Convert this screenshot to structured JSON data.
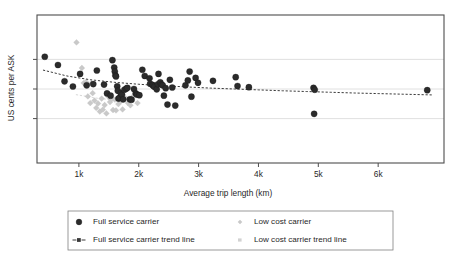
{
  "chart_data": {
    "type": "scatter",
    "title": "",
    "xlabel": "Average trip length (km)",
    "ylabel": "US cents per ASK",
    "xlim": [
      300,
      7100
    ],
    "ylim": [
      0,
      10
    ],
    "xticks": [
      1000,
      2000,
      3000,
      4000,
      5000,
      6000
    ],
    "xticklabels": [
      "1k",
      "2k",
      "3k",
      "4k",
      "5k",
      "6k"
    ],
    "yticks": [
      3.0,
      5.0,
      7.0
    ],
    "yticklabels": [
      "",
      "",
      ""
    ],
    "grid": "horizontal",
    "legend_position": "below-outside",
    "colors": {
      "full_service": "#2b2b2b",
      "low_cost": "#c9c9c9",
      "trend_full_service": "#3a3a3a",
      "trend_low_cost": "#d2d2d2",
      "frame": "#4d4d4d",
      "gridline": "#d8d8d8",
      "background": "#ffffff"
    },
    "series": [
      {
        "name": "Full service carrier",
        "marker": "circle",
        "color": "#2b2b2b",
        "points": [
          [
            430,
            7.18
          ],
          [
            650,
            6.62
          ],
          [
            760,
            5.52
          ],
          [
            900,
            5.17
          ],
          [
            1020,
            6.02
          ],
          [
            1130,
            5.25
          ],
          [
            1240,
            5.33
          ],
          [
            1300,
            6.25
          ],
          [
            1420,
            5.3
          ],
          [
            1470,
            4.7
          ],
          [
            1530,
            4.55
          ],
          [
            1560,
            6.95
          ],
          [
            1590,
            6.45
          ],
          [
            1600,
            6.18
          ],
          [
            1610,
            5.92
          ],
          [
            1620,
            5.85
          ],
          [
            1640,
            5.18
          ],
          [
            1650,
            4.88
          ],
          [
            1660,
            4.35
          ],
          [
            1680,
            4.4
          ],
          [
            1700,
            4.72
          ],
          [
            1720,
            4.62
          ],
          [
            1740,
            4.3
          ],
          [
            1760,
            4.95
          ],
          [
            1790,
            5.02
          ],
          [
            1810,
            5.08
          ],
          [
            1850,
            4.3
          ],
          [
            1880,
            4.28
          ],
          [
            1920,
            5.0
          ],
          [
            1950,
            4.7
          ],
          [
            1970,
            4.62
          ],
          [
            2010,
            4.58
          ],
          [
            2060,
            6.3
          ],
          [
            2100,
            5.88
          ],
          [
            2180,
            5.72
          ],
          [
            2190,
            5.35
          ],
          [
            2230,
            5.28
          ],
          [
            2240,
            5.22
          ],
          [
            2260,
            5.15
          ],
          [
            2300,
            4.98
          ],
          [
            2320,
            5.32
          ],
          [
            2330,
            6.02
          ],
          [
            2360,
            5.45
          ],
          [
            2380,
            5.3
          ],
          [
            2400,
            5.25
          ],
          [
            2420,
            4.55
          ],
          [
            2450,
            5.05
          ],
          [
            2480,
            3.95
          ],
          [
            2520,
            5.62
          ],
          [
            2560,
            5.1
          ],
          [
            2610,
            3.88
          ],
          [
            2780,
            5.25
          ],
          [
            2820,
            5.58
          ],
          [
            2850,
            6.18
          ],
          [
            2880,
            4.48
          ],
          [
            2950,
            5.75
          ],
          [
            2990,
            5.42
          ],
          [
            3240,
            5.55
          ],
          [
            3620,
            5.8
          ],
          [
            3650,
            5.2
          ],
          [
            3840,
            5.12
          ],
          [
            4920,
            5.08
          ],
          [
            4940,
            4.95
          ],
          [
            4930,
            3.32
          ],
          [
            6820,
            4.92
          ]
        ]
      },
      {
        "name": "Low cost carrier",
        "marker": "diamond",
        "color": "#c9c9c9",
        "points": [
          [
            960,
            8.15
          ],
          [
            1050,
            6.42
          ],
          [
            1080,
            5.4
          ],
          [
            1120,
            5.48
          ],
          [
            1150,
            4.5
          ],
          [
            1190,
            4.05
          ],
          [
            1210,
            5.38
          ],
          [
            1230,
            4.72
          ],
          [
            1260,
            4.22
          ],
          [
            1290,
            3.72
          ],
          [
            1320,
            4.02
          ],
          [
            1350,
            3.48
          ],
          [
            1380,
            4.35
          ],
          [
            1400,
            3.6
          ],
          [
            1430,
            3.92
          ],
          [
            1460,
            3.35
          ],
          [
            1500,
            4.45
          ],
          [
            1520,
            4.12
          ],
          [
            1550,
            4.35
          ],
          [
            1570,
            3.58
          ],
          [
            1600,
            4.28
          ],
          [
            1620,
            3.55
          ],
          [
            1660,
            3.98
          ],
          [
            1700,
            4.18
          ],
          [
            1730,
            3.62
          ],
          [
            1780,
            4.38
          ],
          [
            1820,
            4.05
          ],
          [
            1860,
            3.9
          ],
          [
            1900,
            4.48
          ],
          [
            1980,
            4.05
          ]
        ]
      }
    ],
    "trendlines": [
      {
        "name": "Full service carrier trend line",
        "style": "dashed",
        "color": "#3a3a3a",
        "points": [
          [
            400,
            6.28
          ],
          [
            800,
            5.88
          ],
          [
            1200,
            5.62
          ],
          [
            1600,
            5.45
          ],
          [
            2000,
            5.32
          ],
          [
            2400,
            5.22
          ],
          [
            2800,
            5.14
          ],
          [
            3200,
            5.06
          ],
          [
            3600,
            5.0
          ],
          [
            4000,
            4.94
          ],
          [
            4400,
            4.88
          ],
          [
            4800,
            4.83
          ],
          [
            5200,
            4.78
          ],
          [
            5600,
            4.73
          ],
          [
            6000,
            4.69
          ],
          [
            6400,
            4.65
          ],
          [
            6900,
            4.6
          ]
        ]
      },
      {
        "name": "Low cost carrier trend line",
        "style": "dashed",
        "color": "#d8d8d8",
        "points": [
          [
            950,
            4.62
          ],
          [
            1300,
            4.38
          ],
          [
            1650,
            4.22
          ],
          [
            2000,
            4.1
          ]
        ]
      }
    ]
  },
  "legend": {
    "items": [
      {
        "label": "Full service carrier",
        "marker": "circle",
        "color": "#2b2b2b"
      },
      {
        "label": "Low cost carrier",
        "marker": "diamond-faint",
        "color": "#c9c9c9"
      },
      {
        "label": "Full service carrier trend line",
        "marker": "dash-square-dash",
        "color": "#3a3a3a"
      },
      {
        "label": "Low cost carrier trend line",
        "marker": "dash-faint",
        "color": "#d2d2d2"
      }
    ]
  }
}
